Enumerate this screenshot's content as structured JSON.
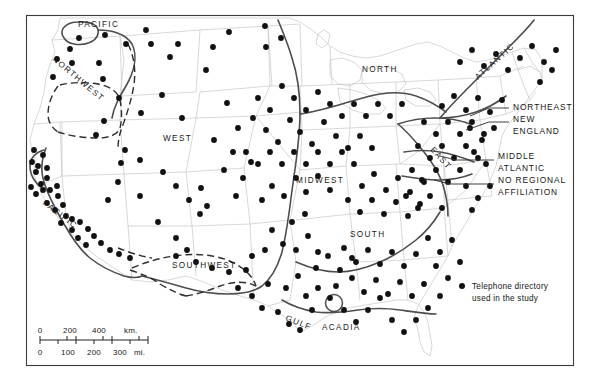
{
  "figure": {
    "type": "thematic-dot-map",
    "frame_color": "#3a3a3a",
    "dot_color": "#111111",
    "region_boundary_color": "#4a4a4a",
    "state_outline_color": "#b9b9b9",
    "dashed_boundary_color": "#2e2e2e"
  },
  "region_labels": [
    {
      "id": "pacific-north",
      "text": "PACIFIC",
      "x": 78,
      "y": 27,
      "rotate": 0
    },
    {
      "id": "northwest",
      "text": "NORTHWEST",
      "x": 52,
      "y": 60,
      "rotate": 40
    },
    {
      "id": "west",
      "text": "WEST",
      "x": 163,
      "y": 141,
      "rotate": 0
    },
    {
      "id": "pacific-south",
      "text": "PACIFIC",
      "x": 42,
      "y": 204,
      "rotate": 37
    },
    {
      "id": "southwest",
      "text": "SOUTHWEST",
      "x": 172,
      "y": 268,
      "rotate": 0
    },
    {
      "id": "midwest",
      "text": "MIDWEST",
      "x": 296,
      "y": 183,
      "rotate": 0
    },
    {
      "id": "north",
      "text": "NORTH",
      "x": 362,
      "y": 72,
      "rotate": 0
    },
    {
      "id": "south",
      "text": "SOUTH",
      "x": 350,
      "y": 237,
      "rotate": 0
    },
    {
      "id": "gulf",
      "text": "GULF",
      "x": 285,
      "y": 320,
      "rotate": 22
    },
    {
      "id": "acadia",
      "text": "ACADIA",
      "x": 322,
      "y": 330,
      "rotate": 0
    },
    {
      "id": "east",
      "text": "EAST",
      "x": 430,
      "y": 150,
      "rotate": 48
    },
    {
      "id": "atlantic",
      "text": "ATLANTIC",
      "x": 478,
      "y": 80,
      "rotate": -42
    }
  ],
  "side_labels": [
    {
      "id": "northeast",
      "lines": [
        "NORTHEAST"
      ],
      "x": 513,
      "y": 110
    },
    {
      "id": "new-england",
      "lines": [
        "NEW",
        "ENGLAND"
      ],
      "x": 513,
      "y": 122
    },
    {
      "id": "middle-atlantic",
      "lines": [
        "MIDDLE",
        "ATLANTIC"
      ],
      "x": 498,
      "y": 159
    },
    {
      "id": "no-regional-affiliation",
      "lines": [
        "NO REGIONAL",
        "AFFILIATION"
      ],
      "x": 498,
      "y": 183
    }
  ],
  "legend": {
    "dot_x": 462,
    "dot_y": 286,
    "lines": [
      "Telephone directory",
      "used in the study"
    ]
  },
  "scale_bar": {
    "km_labels": [
      "0",
      "200",
      "400",
      "km."
    ],
    "mi_labels": [
      "0",
      "100",
      "200",
      "300",
      "mi."
    ],
    "x": 40,
    "y": 328,
    "width": 108
  },
  "chart_data": {
    "type": "scatter",
    "title": "",
    "n_points": 248,
    "points": [
      [
        79,
        38
      ],
      [
        70,
        49
      ],
      [
        57,
        59
      ],
      [
        53,
        77
      ],
      [
        72,
        63
      ],
      [
        99,
        63
      ],
      [
        103,
        79
      ],
      [
        105,
        35
      ],
      [
        126,
        44
      ],
      [
        151,
        44
      ],
      [
        146,
        30
      ],
      [
        178,
        44
      ],
      [
        213,
        47
      ],
      [
        229,
        32
      ],
      [
        265,
        26
      ],
      [
        266,
        47
      ],
      [
        281,
        38
      ],
      [
        162,
        95
      ],
      [
        182,
        118
      ],
      [
        170,
        57
      ],
      [
        206,
        70
      ],
      [
        227,
        103
      ],
      [
        238,
        128
      ],
      [
        119,
        98
      ],
      [
        104,
        121
      ],
      [
        96,
        135
      ],
      [
        141,
        113
      ],
      [
        125,
        150
      ],
      [
        121,
        163
      ],
      [
        34,
        150
      ],
      [
        43,
        155
      ],
      [
        32,
        162
      ],
      [
        38,
        166
      ],
      [
        47,
        168
      ],
      [
        36,
        172
      ],
      [
        47,
        178
      ],
      [
        41,
        184
      ],
      [
        31,
        187
      ],
      [
        43,
        190
      ],
      [
        36,
        194
      ],
      [
        50,
        190
      ],
      [
        57,
        186
      ],
      [
        58,
        196
      ],
      [
        47,
        203
      ],
      [
        63,
        205
      ],
      [
        55,
        210
      ],
      [
        66,
        216
      ],
      [
        72,
        219
      ],
      [
        61,
        223
      ],
      [
        80,
        222
      ],
      [
        72,
        230
      ],
      [
        88,
        229
      ],
      [
        78,
        238
      ],
      [
        94,
        236
      ],
      [
        86,
        245
      ],
      [
        101,
        243
      ],
      [
        110,
        250
      ],
      [
        119,
        254
      ],
      [
        130,
        258
      ],
      [
        140,
        160
      ],
      [
        118,
        182
      ],
      [
        108,
        200
      ],
      [
        140,
        196
      ],
      [
        163,
        172
      ],
      [
        176,
        186
      ],
      [
        189,
        200
      ],
      [
        201,
        188
      ],
      [
        207,
        206
      ],
      [
        158,
        222
      ],
      [
        176,
        238
      ],
      [
        187,
        250
      ],
      [
        200,
        214
      ],
      [
        214,
        140
      ],
      [
        233,
        152
      ],
      [
        224,
        170
      ],
      [
        243,
        178
      ],
      [
        236,
        196
      ],
      [
        251,
        162
      ],
      [
        176,
        256
      ],
      [
        196,
        262
      ],
      [
        212,
        268
      ],
      [
        229,
        272
      ],
      [
        246,
        270
      ],
      [
        252,
        256
      ],
      [
        265,
        250
      ],
      [
        238,
        288
      ],
      [
        252,
        296
      ],
      [
        268,
        284
      ],
      [
        262,
        308
      ],
      [
        278,
        312
      ],
      [
        289,
        324
      ],
      [
        300,
        330
      ],
      [
        286,
        288
      ],
      [
        298,
        276
      ],
      [
        306,
        296
      ],
      [
        312,
        310
      ],
      [
        318,
        288
      ],
      [
        330,
        298
      ],
      [
        336,
        286
      ],
      [
        272,
        230
      ],
      [
        283,
        244
      ],
      [
        296,
        250
      ],
      [
        308,
        236
      ],
      [
        318,
        252
      ],
      [
        292,
        222
      ],
      [
        305,
        214
      ],
      [
        262,
        200
      ],
      [
        272,
        186
      ],
      [
        284,
        196
      ],
      [
        296,
        178
      ],
      [
        306,
        192
      ],
      [
        318,
        176
      ],
      [
        330,
        190
      ],
      [
        253,
        118
      ],
      [
        266,
        130
      ],
      [
        278,
        142
      ],
      [
        290,
        120
      ],
      [
        300,
        132
      ],
      [
        312,
        144
      ],
      [
        324,
        122
      ],
      [
        246,
        152
      ],
      [
        258,
        164
      ],
      [
        270,
        152
      ],
      [
        282,
        164
      ],
      [
        294,
        152
      ],
      [
        306,
        164
      ],
      [
        318,
        152
      ],
      [
        330,
        164
      ],
      [
        342,
        152
      ],
      [
        354,
        164
      ],
      [
        336,
        136
      ],
      [
        348,
        148
      ],
      [
        360,
        136
      ],
      [
        372,
        148
      ],
      [
        258,
        98
      ],
      [
        270,
        110
      ],
      [
        282,
        86
      ],
      [
        294,
        98
      ],
      [
        306,
        110
      ],
      [
        318,
        92
      ],
      [
        330,
        104
      ],
      [
        342,
        116
      ],
      [
        354,
        104
      ],
      [
        366,
        116
      ],
      [
        378,
        104
      ],
      [
        390,
        116
      ],
      [
        402,
        104
      ],
      [
        362,
        186
      ],
      [
        374,
        174
      ],
      [
        386,
        190
      ],
      [
        398,
        178
      ],
      [
        410,
        192
      ],
      [
        422,
        180
      ],
      [
        348,
        200
      ],
      [
        360,
        212
      ],
      [
        372,
        200
      ],
      [
        384,
        214
      ],
      [
        396,
        202
      ],
      [
        408,
        216
      ],
      [
        420,
        204
      ],
      [
        344,
        248
      ],
      [
        356,
        262
      ],
      [
        368,
        250
      ],
      [
        380,
        264
      ],
      [
        392,
        252
      ],
      [
        404,
        266
      ],
      [
        416,
        254
      ],
      [
        352,
        278
      ],
      [
        364,
        292
      ],
      [
        376,
        280
      ],
      [
        388,
        294
      ],
      [
        400,
        282
      ],
      [
        412,
        296
      ],
      [
        424,
        284
      ],
      [
        428,
        238
      ],
      [
        440,
        252
      ],
      [
        452,
        240
      ],
      [
        436,
        266
      ],
      [
        448,
        278
      ],
      [
        460,
        262
      ],
      [
        424,
        122
      ],
      [
        436,
        134
      ],
      [
        448,
        122
      ],
      [
        460,
        134
      ],
      [
        472,
        122
      ],
      [
        484,
        134
      ],
      [
        418,
        146
      ],
      [
        430,
        158
      ],
      [
        442,
        146
      ],
      [
        454,
        158
      ],
      [
        466,
        146
      ],
      [
        478,
        158
      ],
      [
        412,
        170
      ],
      [
        424,
        182
      ],
      [
        436,
        170
      ],
      [
        448,
        182
      ],
      [
        460,
        170
      ],
      [
        406,
        196
      ],
      [
        418,
        208
      ],
      [
        430,
        196
      ],
      [
        442,
        208
      ],
      [
        442,
        106
      ],
      [
        454,
        96
      ],
      [
        466,
        110
      ],
      [
        478,
        98
      ],
      [
        490,
        112
      ],
      [
        502,
        100
      ],
      [
        460,
        62
      ],
      [
        472,
        50
      ],
      [
        484,
        66
      ],
      [
        496,
        54
      ],
      [
        508,
        70
      ],
      [
        520,
        58
      ],
      [
        532,
        46
      ],
      [
        544,
        62
      ],
      [
        556,
        50
      ],
      [
        540,
        82
      ],
      [
        552,
        70
      ],
      [
        470,
        128
      ],
      [
        482,
        140
      ],
      [
        494,
        128
      ],
      [
        474,
        152
      ],
      [
        486,
        164
      ],
      [
        466,
        186
      ],
      [
        478,
        198
      ],
      [
        490,
        186
      ],
      [
        472,
        210
      ],
      [
        392,
        320
      ],
      [
        404,
        332
      ],
      [
        416,
        320
      ],
      [
        428,
        308
      ],
      [
        440,
        296
      ],
      [
        344,
        310
      ],
      [
        356,
        322
      ],
      [
        368,
        310
      ],
      [
        380,
        298
      ],
      [
        316,
        268
      ],
      [
        328,
        256
      ],
      [
        340,
        270
      ],
      [
        352,
        258
      ]
    ],
    "xlabel": "",
    "ylabel": "",
    "grid": false,
    "legend_position": "right"
  }
}
